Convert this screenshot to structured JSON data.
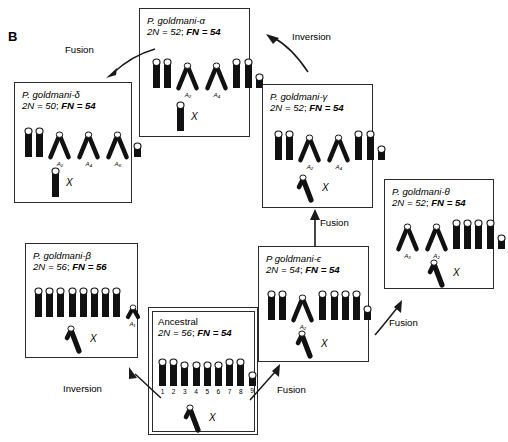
{
  "figure": {
    "panel_letter": "B",
    "background": "#ffffff",
    "chromosome_color": "#111111"
  },
  "boxes": [
    {
      "id": "alpha",
      "name": "P. goldmani-α",
      "line2_prefix": "2",
      "line2": "2N = 52; FN = 54",
      "diploid_label": "2N = 52",
      "fn_label": "FN = 54",
      "x_label": "X",
      "x_shape": "rod",
      "chromosomes": [
        {
          "shape": "rod",
          "height": 30,
          "sub": ""
        },
        {
          "shape": "rod",
          "height": 30,
          "sub": ""
        },
        {
          "shape": "v",
          "height": 26,
          "sub": "A₂"
        },
        {
          "shape": "v",
          "height": 26,
          "sub": "A₄"
        },
        {
          "shape": "rod",
          "height": 30,
          "sub": ""
        },
        {
          "shape": "rod",
          "height": 30,
          "sub": ""
        },
        {
          "shape": "short",
          "height": 15,
          "sub": ""
        }
      ]
    },
    {
      "id": "delta",
      "name": "P. goldmani-δ",
      "line2": "2N = 50; FN = 54",
      "diploid_label": "2N = 50",
      "fn_label": "FN = 54",
      "x_label": "X",
      "x_shape": "rod",
      "chromosomes": [
        {
          "shape": "rod",
          "height": 30,
          "sub": ""
        },
        {
          "shape": "rod",
          "height": 30,
          "sub": ""
        },
        {
          "shape": "v",
          "height": 26,
          "sub": "A₂"
        },
        {
          "shape": "v",
          "height": 26,
          "sub": "A₄"
        },
        {
          "shape": "v",
          "height": 26,
          "sub": "A₆"
        },
        {
          "shape": "short",
          "height": 15,
          "sub": ""
        }
      ]
    },
    {
      "id": "gamma",
      "name": "P. goldmani-γ",
      "line2": "2N = 52; FN = 54",
      "diploid_label": "2N = 52",
      "fn_label": "FN = 54",
      "x_label": "X",
      "x_shape": "hook",
      "chromosomes": [
        {
          "shape": "rod",
          "height": 30,
          "sub": ""
        },
        {
          "shape": "rod",
          "height": 30,
          "sub": ""
        },
        {
          "shape": "v",
          "height": 26,
          "sub": "A₂"
        },
        {
          "shape": "v",
          "height": 26,
          "sub": "A₄"
        },
        {
          "shape": "rod",
          "height": 30,
          "sub": ""
        },
        {
          "shape": "rod",
          "height": 30,
          "sub": ""
        },
        {
          "shape": "short",
          "height": 15,
          "sub": ""
        }
      ]
    },
    {
      "id": "theta",
      "name": "P. goldmani-θ",
      "line2": "2N = 52; FN = 54",
      "diploid_label": "2N = 52",
      "fn_label": "FN = 54",
      "x_label": "X",
      "x_shape": "hook",
      "chromosomes": [
        {
          "shape": "v",
          "height": 26,
          "sub": "A₃"
        },
        {
          "shape": "v",
          "height": 26,
          "sub": "A₂"
        },
        {
          "shape": "rod",
          "height": 30,
          "sub": ""
        },
        {
          "shape": "rod",
          "height": 30,
          "sub": ""
        },
        {
          "shape": "rod",
          "height": 30,
          "sub": ""
        },
        {
          "shape": "rod",
          "height": 30,
          "sub": ""
        },
        {
          "shape": "short",
          "height": 15,
          "sub": ""
        }
      ]
    },
    {
      "id": "beta",
      "name": "P. goldmani-β",
      "line2": "2N = 56; FN = 56",
      "diploid_label": "2N = 56",
      "fn_label": "FN = 56",
      "x_label": "X",
      "x_shape": "hook",
      "chromosomes": [
        {
          "shape": "rod",
          "height": 30,
          "sub": ""
        },
        {
          "shape": "rod",
          "height": 30,
          "sub": ""
        },
        {
          "shape": "rod",
          "height": 30,
          "sub": ""
        },
        {
          "shape": "rod",
          "height": 30,
          "sub": ""
        },
        {
          "shape": "rod",
          "height": 30,
          "sub": ""
        },
        {
          "shape": "rod",
          "height": 30,
          "sub": ""
        },
        {
          "shape": "rod",
          "height": 30,
          "sub": ""
        },
        {
          "shape": "rod",
          "height": 30,
          "sub": ""
        },
        {
          "shape": "smallv",
          "height": 13,
          "sub": "A₁"
        }
      ]
    },
    {
      "id": "epsilon",
      "name": "P goldmani-ϵ",
      "line2": "2N = 54; FN = 54",
      "diploid_label": "2N = 54",
      "fn_label": "FN = 54",
      "x_label": "X",
      "x_shape": "hook",
      "chromosomes": [
        {
          "shape": "rod",
          "height": 30,
          "sub": ""
        },
        {
          "shape": "rod",
          "height": 30,
          "sub": ""
        },
        {
          "shape": "v",
          "height": 26,
          "sub": "A₂"
        },
        {
          "shape": "rod",
          "height": 30,
          "sub": ""
        },
        {
          "shape": "rod",
          "height": 30,
          "sub": ""
        },
        {
          "shape": "rod",
          "height": 30,
          "sub": ""
        },
        {
          "shape": "rod",
          "height": 30,
          "sub": ""
        },
        {
          "shape": "short",
          "height": 15,
          "sub": ""
        }
      ]
    },
    {
      "id": "ancestral",
      "name": "Ancestral",
      "line2": "2N = 56; FN = 54",
      "diploid_label": "2N = 56",
      "fn_label": "FN = 54",
      "x_label": "X",
      "x_shape": "hook",
      "double_border": true,
      "chromosomes": [
        {
          "shape": "rod",
          "height": 28,
          "sub": "",
          "num": "1"
        },
        {
          "shape": "rod",
          "height": 28,
          "sub": "",
          "num": "2"
        },
        {
          "shape": "rod",
          "height": 25,
          "sub": "",
          "num": "3"
        },
        {
          "shape": "rod",
          "height": 25,
          "sub": "",
          "num": "4"
        },
        {
          "shape": "rod",
          "height": 25,
          "sub": "",
          "num": "5"
        },
        {
          "shape": "rod",
          "height": 25,
          "sub": "",
          "num": "6"
        },
        {
          "shape": "rod",
          "height": 28,
          "sub": "",
          "num": "7"
        },
        {
          "shape": "rod",
          "height": 28,
          "sub": "",
          "num": "8"
        },
        {
          "shape": "short",
          "height": 15,
          "sub": "",
          "num": "9"
        }
      ]
    }
  ],
  "arrows": [
    {
      "id": "fusion-gamma-to-alpha",
      "label": "Fusion"
    },
    {
      "id": "fusion-alpha-to-delta",
      "label": "Fusion"
    },
    {
      "id": "inversion-gamma-up",
      "label": "Inversion"
    },
    {
      "id": "fusion-epsilon-to-gamma",
      "label": "Fusion"
    },
    {
      "id": "fusion-epsilon-to-theta",
      "label": "Fusion"
    },
    {
      "id": "fusion-ancestral-to-epsilon",
      "label": "Fusion"
    },
    {
      "id": "inversion-ancestral-to-beta",
      "label": "Inversion"
    }
  ]
}
